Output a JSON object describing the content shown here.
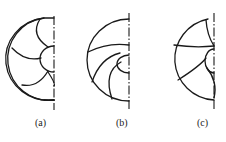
{
  "figure": {
    "panels": [
      {
        "id": "a",
        "label": "(a)",
        "description": "Impeller half-section with backward curved blades (4 arc blades from hub)"
      },
      {
        "id": "b",
        "label": "(b)",
        "description": "Impeller half-section with swept blades curving toward hub"
      },
      {
        "id": "c",
        "label": "(c)",
        "description": "Impeller half-section with mixed radial/curved blades"
      }
    ],
    "stroke_color": "#1a1a1a",
    "background": "#ffffff"
  }
}
